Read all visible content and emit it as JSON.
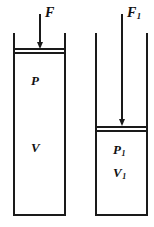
{
  "figure": {
    "type": "piston-cylinder-diagram",
    "ink_color": "#1a1a1a",
    "background_color": "#ffffff",
    "width": 154,
    "height": 227
  },
  "cylinders": [
    {
      "id": "left",
      "force_label": "F",
      "force_subscript": "",
      "pressure_label": "P",
      "pressure_subscript": "",
      "volume_label": "V",
      "volume_subscript": "",
      "piston_position": "near-top",
      "state": "uncompressed"
    },
    {
      "id": "right",
      "force_label": "F",
      "force_subscript": "1",
      "pressure_label": "P",
      "pressure_subscript": "1",
      "volume_label": "V",
      "volume_subscript": "1",
      "piston_position": "lowered",
      "state": "compressed"
    }
  ],
  "arrows": [
    {
      "id": "left-force-arrow",
      "direction": "down"
    },
    {
      "id": "right-force-arrow",
      "direction": "down"
    }
  ]
}
